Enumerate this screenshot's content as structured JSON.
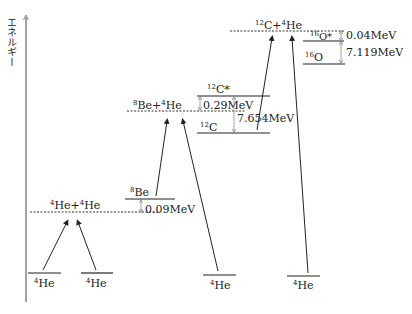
{
  "axis": {
    "label": "エネルギー"
  },
  "levels": {
    "he4_1": {
      "mass": "4",
      "name": "He"
    },
    "he4_2": {
      "mass": "4",
      "name": "He"
    },
    "he4_3": {
      "mass": "4",
      "name": "He"
    },
    "he4_4": {
      "mass": "4",
      "name": "He"
    },
    "he_he": {
      "m1": "4",
      "n1": "He+",
      "m2": "4",
      "n2": "He"
    },
    "be8": {
      "mass": "8",
      "name": "Be"
    },
    "be_he": {
      "m1": "8",
      "n1": "Be+",
      "m2": "4",
      "n2": "He"
    },
    "c12_star": {
      "mass": "12",
      "name": "C*"
    },
    "c12": {
      "mass": "12",
      "name": "C"
    },
    "c_he": {
      "m1": "12",
      "n1": "C+",
      "m2": "4",
      "n2": "He"
    },
    "o16_star": {
      "mass": "16",
      "name": "O*"
    },
    "o16": {
      "mass": "16",
      "name": "O"
    }
  },
  "gaps": {
    "be8_gap": "0.09MeV",
    "c12_star_gap": "0.29MeV",
    "c12_excitation": "7.654MeV",
    "o16_star_gap": "0.04MeV",
    "o16_excitation": "7.119MeV"
  }
}
